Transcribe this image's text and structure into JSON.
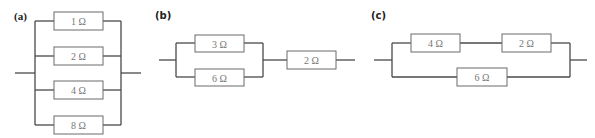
{
  "diagrams": {
    "a": {
      "label": "(a)",
      "resistors": [
        {
          "value": "1 Ω"
        },
        {
          "value": "2 Ω"
        },
        {
          "value": "4 Ω"
        },
        {
          "value": "8 Ω"
        }
      ],
      "configuration": "parallel"
    },
    "b": {
      "label": "(b)",
      "resistors": [
        {
          "value": "3 Ω"
        },
        {
          "value": "6 Ω"
        },
        {
          "value": "2 Ω"
        }
      ],
      "configuration": "3 Ω and 6 Ω in parallel, in series with 2 Ω"
    },
    "c": {
      "label": "(c)",
      "resistors": [
        {
          "value": "4 Ω"
        },
        {
          "value": "2 Ω"
        },
        {
          "value": "6 Ω"
        }
      ],
      "configuration": "4 Ω and 2 Ω in series, in parallel with 6 Ω"
    }
  },
  "colors": {
    "wire": "#4a4a4a",
    "resistor_border": "#6a6a6a",
    "resistor_text": "#777777",
    "label_text": "#222222",
    "background": "#ffffff"
  }
}
